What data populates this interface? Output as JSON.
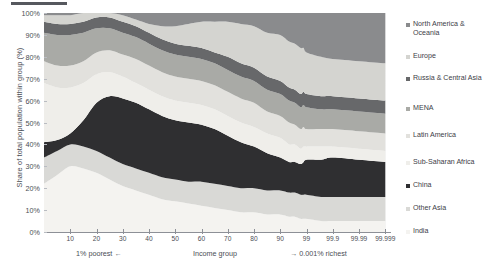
{
  "chart_data": {
    "type": "area",
    "title": "",
    "subtitle": "",
    "xlabel": "Income group",
    "ylabel": "Share of total population within group (%)",
    "stacked": true,
    "normalized": true,
    "grid": true,
    "legend_position": "right",
    "ylim": [
      0,
      100
    ],
    "ytick_labels": [
      "100%",
      "90%",
      "80%",
      "70%",
      "60%",
      "50%",
      "40%",
      "30%",
      "20%",
      "10%",
      "0%"
    ],
    "ytick_values": [
      100,
      90,
      80,
      70,
      60,
      50,
      40,
      30,
      20,
      10,
      0
    ],
    "xtick_labels": [
      "10",
      "20",
      "30",
      "40",
      "50",
      "60",
      "70",
      "80",
      "90",
      "99",
      "99.9",
      "99.99",
      "99.999"
    ],
    "xtick_positions": [
      10,
      20,
      30,
      40,
      50,
      60,
      70,
      80,
      90,
      99,
      99.9,
      99.99,
      99.999
    ],
    "x_caption_left": "1% poorest ←",
    "x_caption_mid": "Income group",
    "x_caption_right": "→ 0.001% richest",
    "x": [
      0,
      5,
      10,
      15,
      20,
      25,
      30,
      35,
      40,
      45,
      50,
      55,
      60,
      65,
      70,
      75,
      80,
      85,
      90,
      93,
      95,
      97,
      98,
      99,
      99.5,
      99.9,
      99.99,
      99.999
    ],
    "series": [
      {
        "name": "India",
        "color": "#f4f3f0",
        "values": [
          22,
          26,
          30,
          29,
          27,
          24,
          21,
          19,
          17,
          15,
          14,
          13,
          12,
          11,
          10,
          9,
          9,
          8,
          8,
          7,
          7,
          6,
          6,
          6,
          5,
          5,
          5,
          5
        ]
      },
      {
        "name": "Other Asia",
        "color": "#d9d9d6",
        "values": [
          12,
          11,
          10,
          10,
          10,
          10,
          10,
          10,
          10,
          10,
          10,
          10,
          11,
          11,
          11,
          11,
          11,
          11,
          11,
          11,
          11,
          11,
          11,
          11,
          11,
          11,
          11,
          11
        ]
      },
      {
        "name": "China",
        "color": "#2f2f31",
        "values": [
          7,
          5,
          5,
          12,
          22,
          28,
          30,
          30,
          29,
          28,
          27,
          27,
          26,
          25,
          23,
          21,
          19,
          17,
          15,
          14,
          14,
          14,
          15,
          16,
          17,
          18,
          17,
          16
        ]
      },
      {
        "name": "Sub-Saharan Africa",
        "color": "#efeeea",
        "values": [
          27,
          24,
          21,
          17,
          13,
          11,
          10,
          9,
          9,
          9,
          9,
          9,
          9,
          9,
          9,
          9,
          9,
          9,
          9,
          8,
          8,
          7,
          7,
          6,
          6,
          5,
          5,
          5
        ]
      },
      {
        "name": "Latin America",
        "color": "#e2e1dd",
        "values": [
          10,
          10,
          10,
          10,
          10,
          10,
          10,
          11,
          11,
          11,
          11,
          11,
          11,
          11,
          11,
          11,
          11,
          10,
          10,
          10,
          9,
          9,
          9,
          8,
          8,
          8,
          8,
          8
        ]
      },
      {
        "name": "MENA",
        "color": "#a9aaa6",
        "values": [
          13,
          14,
          14,
          13,
          11,
          10,
          10,
          10,
          10,
          10,
          10,
          10,
          10,
          10,
          10,
          10,
          10,
          10,
          10,
          10,
          10,
          10,
          10,
          10,
          9,
          9,
          9,
          9
        ]
      },
      {
        "name": "Russia & Central Asia",
        "color": "#67686a",
        "values": [
          5,
          5,
          5,
          5,
          5,
          5,
          5,
          5,
          5,
          5,
          5,
          5,
          5,
          5,
          6,
          6,
          6,
          6,
          6,
          6,
          6,
          6,
          6,
          6,
          6,
          6,
          6,
          6
        ]
      },
      {
        "name": "Europe",
        "color": "#d4d4d0",
        "values": [
          3,
          4,
          4,
          4,
          2,
          2,
          3,
          3,
          4,
          6,
          8,
          10,
          12,
          14,
          16,
          18,
          19,
          20,
          21,
          21,
          21,
          21,
          20,
          19,
          18,
          17,
          17,
          17
        ]
      },
      {
        "name": "North America & Oceania",
        "color": "#8a8b8d",
        "values": [
          1,
          1,
          1,
          0,
          0,
          0,
          1,
          3,
          5,
          6,
          6,
          5,
          4,
          4,
          4,
          5,
          6,
          9,
          10,
          13,
          14,
          16,
          16,
          18,
          20,
          21,
          22,
          23
        ]
      }
    ]
  },
  "legend": {
    "items": [
      {
        "label": "North America & Oceania",
        "color": "#8a8b8d"
      },
      {
        "label": "Europe",
        "color": "#d4d4d0"
      },
      {
        "label": "Russia & Central Asia",
        "color": "#67686a"
      },
      {
        "label": "MENA",
        "color": "#a9aaa6"
      },
      {
        "label": "Latin America",
        "color": "#e2e1dd"
      },
      {
        "label": "Sub-Saharan Africa",
        "color": "#efeeea"
      },
      {
        "label": "China",
        "color": "#2f2f31"
      },
      {
        "label": "Other Asia",
        "color": "#d9d9d6"
      },
      {
        "label": "India",
        "color": "#f4f3f0"
      }
    ]
  }
}
